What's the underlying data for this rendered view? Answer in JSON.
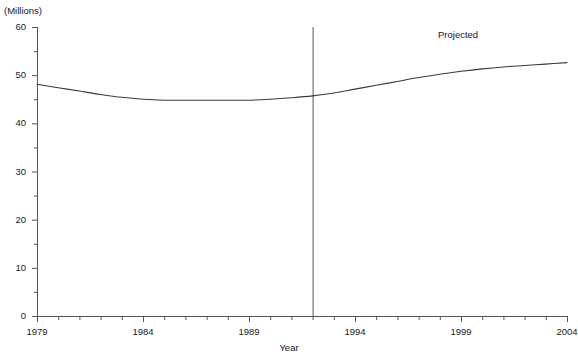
{
  "title": "",
  "units_label": "(Millions)",
  "annotations": {
    "projected": "Projected"
  },
  "chart_data": {
    "type": "line",
    "title": "",
    "xlabel": "Year",
    "ylabel": "",
    "units": "Millions",
    "xlim": [
      1979,
      2004
    ],
    "ylim": [
      0,
      60
    ],
    "grid": false,
    "legend": "none",
    "y_ticks": [
      0,
      10,
      20,
      30,
      40,
      50,
      60
    ],
    "y_minor_ticks": [
      5,
      15,
      25,
      35,
      45,
      55
    ],
    "x_ticks": [
      1979,
      1984,
      1989,
      1994,
      1999,
      2004
    ],
    "x_minor_ticks": [
      1980,
      1981,
      1982,
      1983,
      1985,
      1986,
      1987,
      1988,
      1990,
      1991,
      1992,
      1993,
      1995,
      1996,
      1997,
      1998,
      2000,
      2001,
      2002,
      2003
    ],
    "projection_divider_x": 1992,
    "projection_label": "Projected",
    "series": [
      {
        "name": "Employment",
        "x": [
          1979,
          1980,
          1981,
          1982,
          1983,
          1984,
          1985,
          1986,
          1987,
          1988,
          1989,
          1990,
          1991,
          1992,
          1993,
          1994,
          1995,
          1996,
          1997,
          1998,
          1999,
          2000,
          2001,
          2002,
          2003,
          2004
        ],
        "values": [
          48.1,
          47.4,
          46.7,
          46.0,
          45.4,
          45.0,
          44.8,
          44.8,
          44.8,
          44.8,
          44.8,
          45.0,
          45.3,
          45.7,
          46.3,
          47.1,
          47.9,
          48.7,
          49.5,
          50.2,
          50.8,
          51.3,
          51.7,
          52.0,
          52.3,
          52.6
        ]
      }
    ]
  },
  "axis_geometry": {
    "left_px": 37,
    "right_px": 567,
    "top_px": 27,
    "bottom_px": 316
  }
}
